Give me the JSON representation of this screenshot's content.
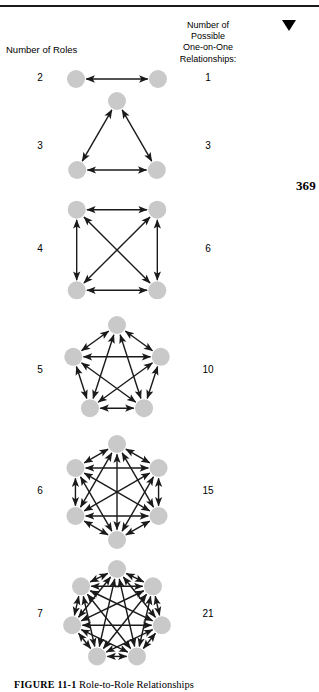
{
  "document": {
    "page_number": "369",
    "top_rule": true,
    "dropdown_marker_icon": "triangle-down-icon"
  },
  "headers": {
    "left": "Number of Roles",
    "right_lines": [
      "Number of",
      "Possible",
      "One-on-One",
      "Relationships:"
    ]
  },
  "caption": {
    "label": "FIGURE 11-1",
    "text": "Role-to-Role Relationships"
  },
  "style": {
    "node_fill": "#c9c9c9",
    "edge_color": "#1a1a1a",
    "text_color": "#000000",
    "background": "#ffffff"
  },
  "chart_data": {
    "type": "diagram",
    "subtype": "complete-graph-series",
    "title": "Role-to-Role Relationships",
    "xlabel": "Number of Roles",
    "ylabel": "Number of Possible One-on-One Relationships:",
    "formula": "n(n-1)/2",
    "categories": [
      2,
      3,
      4,
      5,
      6,
      7
    ],
    "values": [
      1,
      3,
      6,
      10,
      15,
      21
    ],
    "rows": [
      {
        "roles": "2",
        "relationships": "1",
        "node_count": 2,
        "layout": "line",
        "center_x": 117,
        "center_y": 79,
        "radius": 41,
        "node_radius": 9,
        "rotation": 0,
        "box_top": 56,
        "box_height": 48
      },
      {
        "roles": "3",
        "relationships": "3",
        "node_count": 3,
        "layout": "polygon",
        "center_x": 117,
        "center_y": 147,
        "radius": 46,
        "node_radius": 9,
        "rotation": -90,
        "box_top": 98,
        "box_height": 100
      },
      {
        "roles": "4",
        "relationships": "6",
        "node_count": 4,
        "layout": "polygon",
        "center_x": 117,
        "center_y": 250,
        "radius": 57,
        "node_radius": 9,
        "rotation": -135,
        "box_top": 190,
        "box_height": 120
      },
      {
        "roles": "5",
        "relationships": "10",
        "node_count": 5,
        "layout": "polygon",
        "center_x": 117,
        "center_y": 371,
        "radius": 46,
        "node_radius": 9,
        "rotation": -90,
        "box_top": 322,
        "box_height": 98
      },
      {
        "roles": "6",
        "relationships": "15",
        "node_count": 6,
        "layout": "polygon",
        "center_x": 117,
        "center_y": 492,
        "radius": 48,
        "node_radius": 9,
        "rotation": -90,
        "box_top": 441,
        "box_height": 102
      },
      {
        "roles": "7",
        "relationships": "21",
        "node_count": 7,
        "layout": "polygon",
        "center_x": 117,
        "center_y": 615,
        "radius": 46,
        "node_radius": 9,
        "rotation": -90,
        "box_top": 566,
        "box_height": 98
      }
    ]
  }
}
